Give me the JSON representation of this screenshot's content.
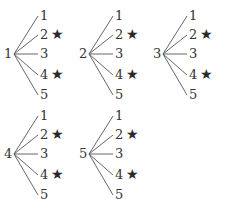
{
  "diagram": {
    "type": "tree-diagram",
    "star_symbol": "★",
    "trees": [
      {
        "root": "1",
        "leaves": [
          {
            "label": "1",
            "star": false
          },
          {
            "label": "2",
            "star": true
          },
          {
            "label": "3",
            "star": false
          },
          {
            "label": "4",
            "star": true
          },
          {
            "label": "5",
            "star": false
          }
        ]
      },
      {
        "root": "2",
        "leaves": [
          {
            "label": "1",
            "star": false
          },
          {
            "label": "2",
            "star": true
          },
          {
            "label": "3",
            "star": false
          },
          {
            "label": "4",
            "star": true
          },
          {
            "label": "5",
            "star": false
          }
        ]
      },
      {
        "root": "3",
        "leaves": [
          {
            "label": "1",
            "star": false
          },
          {
            "label": "2",
            "star": true
          },
          {
            "label": "3",
            "star": false
          },
          {
            "label": "4",
            "star": true
          },
          {
            "label": "5",
            "star": false
          }
        ]
      },
      {
        "root": "4",
        "leaves": [
          {
            "label": "1",
            "star": false
          },
          {
            "label": "2",
            "star": true
          },
          {
            "label": "3",
            "star": false
          },
          {
            "label": "4",
            "star": true
          },
          {
            "label": "5",
            "star": false
          }
        ]
      },
      {
        "root": "5",
        "leaves": [
          {
            "label": "1",
            "star": false
          },
          {
            "label": "2",
            "star": true
          },
          {
            "label": "3",
            "star": false
          },
          {
            "label": "4",
            "star": true
          },
          {
            "label": "5",
            "star": false
          }
        ]
      }
    ]
  }
}
